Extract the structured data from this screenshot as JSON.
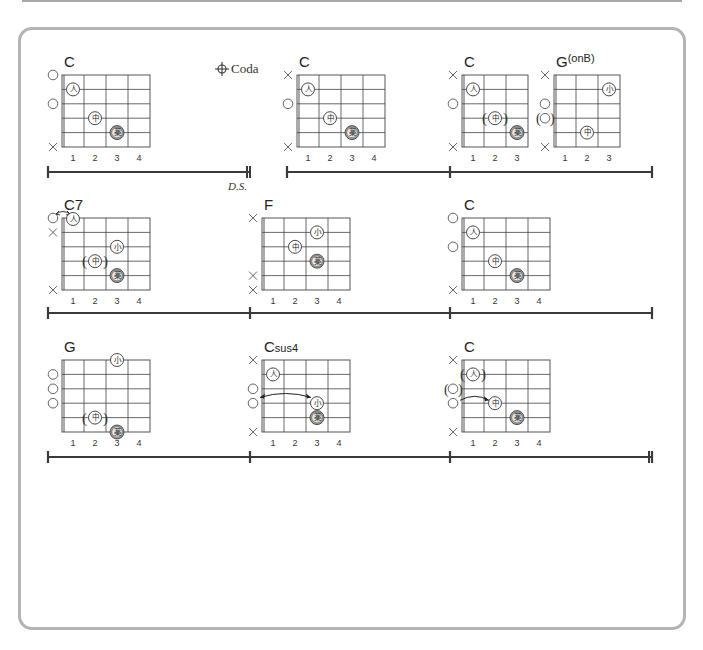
{
  "page": {
    "card_border_color": "#b4b4b4",
    "line_color": "#444444"
  },
  "finger_labels": {
    "1": "人",
    "2": "中",
    "3": "薬",
    "4": "小"
  },
  "markers": {
    "coda_symbol": "⊕",
    "coda_label": "Coda",
    "ds_label": "D.S."
  },
  "rows": [
    {
      "measure_line": {
        "y": 172,
        "segments": [
          [
            48,
            250
          ],
          [
            287,
            450
          ],
          [
            450,
            652
          ]
        ],
        "bars": [
          48,
          287,
          450,
          652
        ],
        "double_bars": [
          250
        ],
        "final_bar": null
      },
      "coda": {
        "x": 218,
        "y": 73,
        "show": true
      },
      "ds": {
        "x": 228,
        "y": 190,
        "show": true
      }
    },
    {
      "measure_line": {
        "y": 313,
        "segments": [
          [
            48,
            250
          ],
          [
            250,
            450
          ],
          [
            450,
            652
          ]
        ],
        "bars": [
          48,
          250,
          450,
          652
        ],
        "double_bars": [],
        "final_bar": null
      },
      "coda": {
        "show": false
      },
      "ds": {
        "show": false
      }
    },
    {
      "measure_line": {
        "y": 457,
        "segments": [
          [
            48,
            250
          ],
          [
            250,
            450
          ],
          [
            450,
            652
          ]
        ],
        "bars": [
          48,
          250,
          450,
          652
        ],
        "double_bars": [],
        "final_bar": 652
      },
      "coda": {
        "show": false
      },
      "ds": {
        "show": false
      }
    }
  ],
  "chords": [
    {
      "name": "C",
      "sup": "",
      "x": 62,
      "y": 75,
      "frets": 4,
      "fret_numbers": [
        "1",
        "2",
        "3",
        "4"
      ],
      "open_marks": [
        {
          "string": 1,
          "type": "o"
        },
        {
          "string": 3,
          "type": "o"
        },
        {
          "string": 6,
          "type": "x"
        }
      ],
      "fingers": [
        {
          "string": 2,
          "fret": 1,
          "finger": "1",
          "shaded": false
        },
        {
          "string": 4,
          "fret": 2,
          "finger": "2",
          "shaded": false
        },
        {
          "string": 5,
          "fret": 3,
          "finger": "3",
          "shaded": true
        }
      ]
    },
    {
      "name": "C",
      "sup": "",
      "x": 297,
      "y": 75,
      "frets": 4,
      "fret_numbers": [
        "1",
        "2",
        "3",
        "4"
      ],
      "open_marks": [
        {
          "string": 1,
          "type": "x"
        },
        {
          "string": 3,
          "type": "o"
        },
        {
          "string": 6,
          "type": "x"
        }
      ],
      "fingers": [
        {
          "string": 2,
          "fret": 1,
          "finger": "1",
          "shaded": false
        },
        {
          "string": 4,
          "fret": 2,
          "finger": "2",
          "shaded": false
        },
        {
          "string": 5,
          "fret": 3,
          "finger": "3",
          "shaded": true
        }
      ]
    },
    {
      "name": "C",
      "sup": "",
      "x": 462,
      "y": 75,
      "frets": 3,
      "fret_numbers": [
        "1",
        "2",
        "3"
      ],
      "open_marks": [
        {
          "string": 1,
          "type": "x"
        },
        {
          "string": 3,
          "type": "o"
        },
        {
          "string": 6,
          "type": "x"
        }
      ],
      "fingers": [
        {
          "string": 2,
          "fret": 1,
          "finger": "1",
          "shaded": false
        },
        {
          "string": 4,
          "fret": 2,
          "finger": "2",
          "shaded": false,
          "paren": true
        },
        {
          "string": 5,
          "fret": 3,
          "finger": "3",
          "shaded": true
        }
      ]
    },
    {
      "name": "G",
      "sup": "(onB)",
      "x": 554,
      "y": 75,
      "frets": 3,
      "fret_numbers": [
        "1",
        "2",
        "3"
      ],
      "open_marks": [
        {
          "string": 1,
          "type": "x"
        },
        {
          "string": 3,
          "type": "o"
        },
        {
          "string": 4,
          "type": "o",
          "paren": true
        },
        {
          "string": 6,
          "type": "x"
        }
      ],
      "fingers": [
        {
          "string": 2,
          "fret": 3,
          "finger": "4",
          "shaded": false
        },
        {
          "string": 5,
          "fret": 2,
          "finger": "2",
          "shaded": false
        }
      ]
    },
    {
      "name": "C7",
      "sup": "",
      "x": 62,
      "y": 218,
      "frets": 4,
      "fret_numbers": [
        "1",
        "2",
        "3",
        "4"
      ],
      "open_marks": [
        {
          "string": 1,
          "type": "o"
        },
        {
          "string": 2,
          "type": "x"
        },
        {
          "string": 6,
          "type": "x"
        }
      ],
      "fingers": [
        {
          "string": 1,
          "fret": 1,
          "finger": "1",
          "shaded": false,
          "above": true
        },
        {
          "string": 3,
          "fret": 3,
          "finger": "4",
          "shaded": false
        },
        {
          "string": 4,
          "fret": 2,
          "finger": "2",
          "shaded": false,
          "paren": true
        },
        {
          "string": 5,
          "fret": 3,
          "finger": "3",
          "shaded": true
        }
      ],
      "arrow": {
        "from_string": 1,
        "from_fret": 0,
        "to_string": 1,
        "to_fret": 1,
        "top": true
      }
    },
    {
      "name": "F",
      "sup": "",
      "x": 262,
      "y": 218,
      "frets": 4,
      "fret_numbers": [
        "1",
        "2",
        "3",
        "4"
      ],
      "open_marks": [
        {
          "string": 1,
          "type": "x"
        },
        {
          "string": 5,
          "type": "x"
        },
        {
          "string": 6,
          "type": "x"
        }
      ],
      "fingers": [
        {
          "string": 2,
          "fret": 3,
          "finger": "4",
          "shaded": false
        },
        {
          "string": 3,
          "fret": 2,
          "finger": "2",
          "shaded": false
        },
        {
          "string": 4,
          "fret": 3,
          "finger": "3",
          "shaded": true
        }
      ]
    },
    {
      "name": "C",
      "sup": "",
      "x": 462,
      "y": 218,
      "frets": 4,
      "fret_numbers": [
        "1",
        "2",
        "3",
        "4"
      ],
      "open_marks": [
        {
          "string": 1,
          "type": "o"
        },
        {
          "string": 3,
          "type": "o"
        },
        {
          "string": 6,
          "type": "x"
        }
      ],
      "fingers": [
        {
          "string": 2,
          "fret": 1,
          "finger": "1",
          "shaded": false
        },
        {
          "string": 4,
          "fret": 2,
          "finger": "2",
          "shaded": false
        },
        {
          "string": 5,
          "fret": 3,
          "finger": "3",
          "shaded": true
        }
      ]
    },
    {
      "name": "G",
      "sup": "",
      "x": 62,
      "y": 360,
      "frets": 4,
      "fret_numbers": [
        "1",
        "2",
        "3",
        "4"
      ],
      "open_marks": [
        {
          "string": 2,
          "type": "o"
        },
        {
          "string": 3,
          "type": "o"
        },
        {
          "string": 4,
          "type": "o"
        }
      ],
      "fingers": [
        {
          "string": 1,
          "fret": 3,
          "finger": "4",
          "shaded": false
        },
        {
          "string": 5,
          "fret": 2,
          "finger": "2",
          "shaded": false,
          "paren": true
        },
        {
          "string": 6,
          "fret": 3,
          "finger": "3",
          "shaded": true
        }
      ]
    },
    {
      "name": "C",
      "sup": "sus4",
      "x": 262,
      "y": 360,
      "frets": 4,
      "fret_numbers": [
        "1",
        "2",
        "3",
        "4"
      ],
      "open_marks": [
        {
          "string": 1,
          "type": "x"
        },
        {
          "string": 3,
          "type": "o"
        },
        {
          "string": 4,
          "type": "o"
        },
        {
          "string": 6,
          "type": "x"
        }
      ],
      "fingers": [
        {
          "string": 2,
          "fret": 1,
          "finger": "1",
          "shaded": false
        },
        {
          "string": 4,
          "fret": 3,
          "finger": "4",
          "shaded": false
        },
        {
          "string": 5,
          "fret": 3,
          "finger": "3",
          "shaded": true
        }
      ],
      "arrow": {
        "from_string": 3.6,
        "from_fret": 0,
        "to_string": 3.6,
        "to_fret": 3,
        "both": true
      }
    },
    {
      "name": "C",
      "sup": "",
      "x": 462,
      "y": 360,
      "frets": 4,
      "fret_numbers": [
        "1",
        "2",
        "3",
        "4"
      ],
      "open_marks": [
        {
          "string": 1,
          "type": "x"
        },
        {
          "string": 3,
          "type": "o",
          "paren": true
        },
        {
          "string": 4,
          "type": "o"
        },
        {
          "string": 6,
          "type": "x"
        }
      ],
      "fingers": [
        {
          "string": 2,
          "fret": 1,
          "finger": "1",
          "shaded": false,
          "paren": true
        },
        {
          "string": 4,
          "fret": 2,
          "finger": "2",
          "shaded": false
        },
        {
          "string": 5,
          "fret": 3,
          "finger": "3",
          "shaded": true
        }
      ],
      "arrow": {
        "from_string": 3.8,
        "from_fret": 0,
        "to_string": 3.8,
        "to_fret": 2,
        "single": true
      }
    }
  ]
}
